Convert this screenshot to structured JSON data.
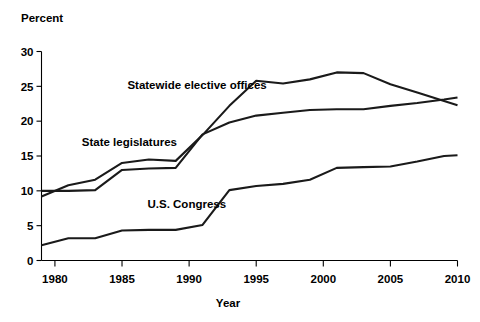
{
  "chart_data": {
    "type": "line",
    "title": "",
    "xlabel": "Year",
    "ylabel": "Percent",
    "xlim": [
      1979,
      2010
    ],
    "ylim": [
      0,
      30
    ],
    "grid": false,
    "legend_position": "inline-annotations",
    "x_ticks": [
      "1980",
      "1985",
      "1990",
      "1995",
      "2000",
      "2005",
      "2010"
    ],
    "x_tick_values": [
      1980,
      1985,
      1990,
      1995,
      2000,
      2005,
      2010
    ],
    "y_ticks": [
      "0",
      "5",
      "10",
      "15",
      "20",
      "25",
      "30"
    ],
    "y_tick_values": [
      0,
      5,
      10,
      15,
      20,
      25,
      30
    ],
    "x": [
      1979,
      1981,
      1983,
      1985,
      1987,
      1989,
      1991,
      1993,
      1995,
      1997,
      1999,
      2001,
      2003,
      2005,
      2007,
      2009,
      2010
    ],
    "series": [
      {
        "name": "Statewide elective offices",
        "label": "Statewide elective offices",
        "label_x": 1985.4,
        "label_y": 24.6,
        "values": [
          9.2,
          10.8,
          11.6,
          14.0,
          14.5,
          14.3,
          18.0,
          22.2,
          25.8,
          25.4,
          26.0,
          27.0,
          26.9,
          25.3,
          24.1,
          22.9,
          22.3
        ]
      },
      {
        "name": "State legislatures",
        "label": "State legislatures",
        "label_x": 1982.0,
        "label_y": 16.5,
        "values": [
          10.0,
          10.0,
          10.1,
          13.0,
          13.2,
          13.3,
          18.1,
          19.8,
          20.8,
          21.2,
          21.6,
          21.7,
          21.7,
          22.2,
          22.6,
          23.1,
          23.4
        ]
      },
      {
        "name": "U.S. Congress",
        "label": "U.S. Congress",
        "label_x": 1986.9,
        "label_y": 7.6,
        "values": [
          2.2,
          3.2,
          3.2,
          4.3,
          4.4,
          4.4,
          5.1,
          10.1,
          10.7,
          11.0,
          11.6,
          13.3,
          13.4,
          13.5,
          14.2,
          15.0,
          15.1
        ]
      }
    ]
  }
}
